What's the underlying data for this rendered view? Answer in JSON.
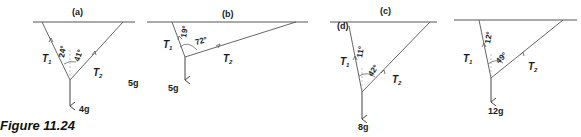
{
  "caption": "Figure 11.24",
  "colors": {
    "line": "#555555",
    "text": "#1a1a1a",
    "background": "#ffffff"
  },
  "panels": [
    {
      "id": "a",
      "label": "(a)",
      "angle_t1": "24°",
      "angle_t2": "41°",
      "t1": "T",
      "t1_sub": "1",
      "t2": "T",
      "t2_sub": "2",
      "weight": "4g",
      "extra": "5g"
    },
    {
      "id": "b",
      "label": "(b)",
      "angle_t1": "19°",
      "angle_t2": "72°",
      "t1": "T",
      "t1_sub": "1",
      "t2": "T",
      "t2_sub": "2",
      "weight": "5g"
    },
    {
      "id": "c",
      "label": "(c)",
      "label2": "(d)",
      "angle_t1": "11°",
      "angle_t2": "42°",
      "t1": "T",
      "t1_sub": "1",
      "t2": "T",
      "t2_sub": "2",
      "weight": "8g"
    },
    {
      "id": "d",
      "angle_t1": "12°",
      "angle_t2": "49°",
      "t1": "T",
      "t1_sub": "1",
      "t2": "T",
      "t2_sub": "2",
      "weight": "12g"
    }
  ]
}
